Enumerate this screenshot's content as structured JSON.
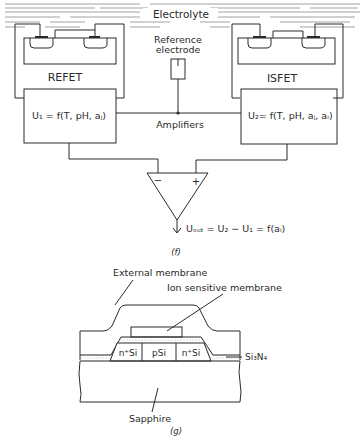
{
  "figure_f": {
    "electrolyte_label": "Electrolyte",
    "reference_electrode_line1": "Reference",
    "reference_electrode_line2": "electrode",
    "refet_label": "REFET",
    "isfet_label": "ISFET",
    "amplifiers_label": "Amplifiers",
    "u1_equation": "U₁ = f(T, pH, aⱼ)",
    "u2_equation": "U₂= f(T, pH, aⱼ, aᵢ)",
    "minus_sign": "−",
    "plus_sign": "+",
    "output_equation": "Uₒᵤₜ = U₂ − U₁ = f(aᵢ)",
    "caption": "(f)"
  },
  "figure_g": {
    "external_membrane_label": "External membrane",
    "ion_sensitive_membrane_label": "Ion sensitive membrane",
    "n_si_left": "n⁺Si",
    "p_si": "pSi",
    "n_si_right": "n⁺Si",
    "si3n4_label": "Si₃N₄",
    "sapphire_label": "Sapphire",
    "caption": "(g)"
  }
}
